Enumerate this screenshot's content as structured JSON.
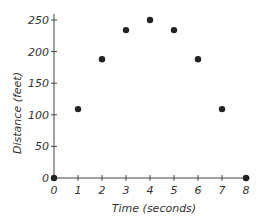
{
  "chart_data": {
    "type": "scatter",
    "title": "",
    "xlabel": "Time (seconds)",
    "ylabel": "Distance (feet)",
    "x": [
      0,
      1,
      2,
      3,
      4,
      5,
      6,
      7,
      8
    ],
    "y": [
      0,
      109,
      188,
      234,
      250,
      234,
      188,
      109,
      0
    ],
    "xlim": [
      0,
      8
    ],
    "ylim": [
      0,
      250
    ],
    "xticks": [
      "0",
      "1",
      "2",
      "3",
      "4",
      "5",
      "6",
      "7",
      "8"
    ],
    "yticks": [
      "0",
      "50",
      "100",
      "150",
      "200",
      "250"
    ],
    "grid": false,
    "legend": null,
    "point_color": "#222222"
  }
}
